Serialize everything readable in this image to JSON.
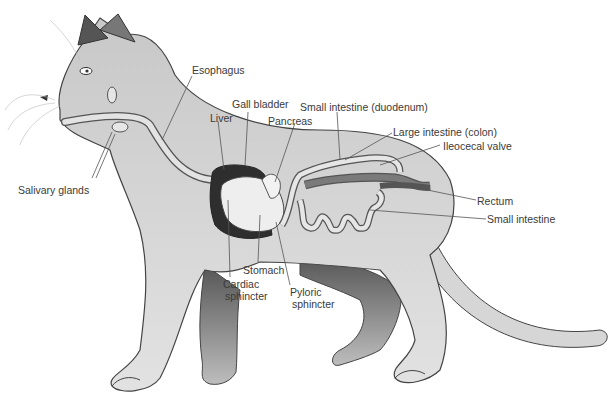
{
  "diagram": {
    "labels": {
      "esophagus": "Esophagus",
      "liver": "Liver",
      "gall_bladder": "Gall bladder",
      "pancreas": "Pancreas",
      "small_intestine_duodenum": "Small intestine (duodenum)",
      "large_intestine_colon": "Large intestine (colon)",
      "ileocecal_valve": "Ileocecal valve",
      "rectum": "Rectum",
      "small_intestine": "Small intestine",
      "salivary_glands": "Salivary glands",
      "stomach": "Stomach",
      "cardiac_sphincter_1": "Cardiac",
      "cardiac_sphincter_2": "sphincter",
      "pyloric_sphincter_1": "Pyloric",
      "pyloric_sphincter_2": "sphincter"
    },
    "colors": {
      "body_fill": "#d9d9d9",
      "body_stroke": "#444444",
      "dark_fur": "#555555",
      "liver_fill": "#2e2e2e",
      "stomach_fill": "#eeeeee",
      "intestine_fill": "#e6e6e6",
      "colon_fill": "#7a7a7a",
      "leader_line": "#555555",
      "label_text": "#3a3a3a"
    }
  }
}
